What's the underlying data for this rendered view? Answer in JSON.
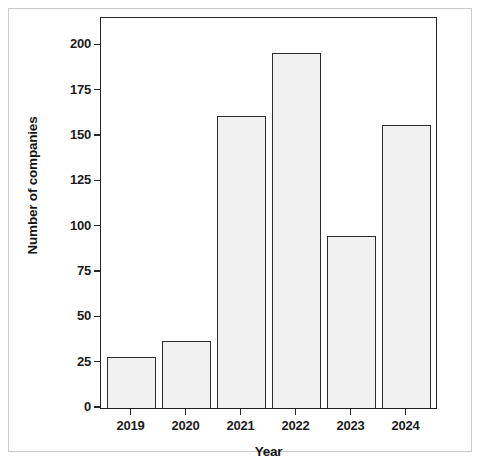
{
  "chart_data": {
    "type": "bar",
    "title": "",
    "xlabel": "Year",
    "ylabel": "Number of companies",
    "categories": [
      "2019",
      "2020",
      "2021",
      "2022",
      "2023",
      "2024"
    ],
    "values": [
      28,
      37,
      161,
      196,
      95,
      156
    ],
    "series": [
      {
        "name": "Number of companies",
        "values": [
          28,
          37,
          161,
          196,
          95,
          156
        ]
      }
    ],
    "ylim": [
      0,
      215
    ],
    "y_ticks": [
      0,
      25,
      50,
      75,
      100,
      125,
      150,
      175,
      200
    ],
    "y_tick_labels": [
      "0",
      "25",
      "50",
      "75",
      "100",
      "125",
      "150",
      "175",
      "200"
    ],
    "x_tick_labels": [
      "2019",
      "2020",
      "2021",
      "2022",
      "2023",
      "2024"
    ],
    "grid": false,
    "legend": false,
    "legend_position": "none",
    "colors": {
      "bar_fill": "#f1f1f1",
      "bar_edge": "#2b2b2b",
      "axis": "#262626",
      "text": "#1c1c1c",
      "background": "#ffffff",
      "frame": "#c9c9c9"
    }
  }
}
